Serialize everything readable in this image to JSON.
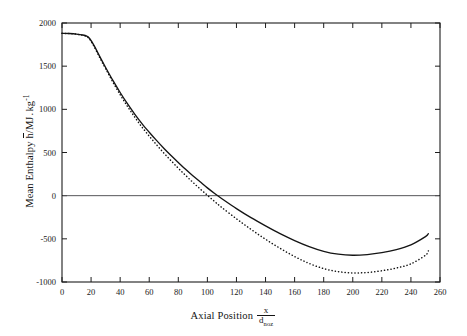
{
  "figure": {
    "background": "#ffffff",
    "foreground": "#141414",
    "zero_line_color": "#56565a"
  },
  "axes": {
    "x": {
      "label_prefix": "Axial Position",
      "label_numerator": "x",
      "label_denominator": "d",
      "label_denominator_sub": "noz",
      "ticks": [
        0,
        20,
        40,
        60,
        80,
        100,
        120,
        140,
        160,
        180,
        200,
        220,
        240,
        260
      ],
      "min": 0,
      "max": 260
    },
    "y": {
      "label_prefix": "Mean Enthalpy",
      "label_symbol": "h",
      "label_unit_num": "/MJ",
      "label_unit_sep": ".",
      "label_unit_den": "kg",
      "label_unit_exp": "-1",
      "ticks": [
        2000,
        1500,
        1000,
        500,
        0,
        -500,
        -1000
      ],
      "min": -1000,
      "max": 2000
    }
  },
  "chart_data": {
    "type": "line",
    "title": "",
    "xlabel": "Axial Position x/d_noz",
    "ylabel": "Mean Enthalpy h̄/MJ . kg⁻¹",
    "xlim": [
      0,
      260
    ],
    "ylim": [
      -1000,
      2000
    ],
    "xticks": [
      0,
      20,
      40,
      60,
      80,
      100,
      120,
      140,
      160,
      180,
      200,
      220,
      240,
      260
    ],
    "yticks": [
      2000,
      1500,
      1000,
      500,
      0,
      -500,
      -1000
    ],
    "grid": false,
    "legend": null,
    "annotations": [
      {
        "type": "hline",
        "y": 0,
        "style": "solid-thin",
        "color": "#56565a"
      }
    ],
    "series": [
      {
        "name": "solid",
        "style": "solid",
        "color": "#141414",
        "x": [
          0,
          5,
          10,
          14,
          17,
          19,
          22,
          26,
          30,
          35,
          40,
          45,
          50,
          55,
          60,
          65,
          70,
          75,
          80,
          85,
          90,
          95,
          100,
          105,
          110,
          120,
          130,
          140,
          150,
          160,
          170,
          180,
          190,
          200,
          210,
          220,
          230,
          240,
          250,
          252
        ],
        "y": [
          1880,
          1878,
          1872,
          1862,
          1848,
          1820,
          1740,
          1610,
          1485,
          1335,
          1195,
          1065,
          945,
          835,
          735,
          640,
          550,
          465,
          385,
          305,
          230,
          160,
          90,
          25,
          -35,
          -150,
          -255,
          -350,
          -440,
          -520,
          -590,
          -645,
          -678,
          -690,
          -682,
          -660,
          -625,
          -570,
          -475,
          -440
        ]
      },
      {
        "name": "dotted",
        "style": "dotted",
        "color": "#141414",
        "x": [
          0,
          5,
          10,
          14,
          17,
          19,
          22,
          26,
          30,
          35,
          40,
          45,
          50,
          55,
          60,
          65,
          70,
          75,
          80,
          85,
          90,
          95,
          100,
          105,
          110,
          120,
          130,
          140,
          150,
          160,
          170,
          180,
          190,
          200,
          210,
          220,
          230,
          240,
          250,
          252
        ],
        "y": [
          1880,
          1877,
          1870,
          1858,
          1843,
          1813,
          1730,
          1598,
          1470,
          1315,
          1170,
          1035,
          910,
          795,
          690,
          590,
          495,
          405,
          318,
          235,
          155,
          78,
          5,
          -68,
          -138,
          -268,
          -390,
          -505,
          -610,
          -705,
          -785,
          -845,
          -880,
          -895,
          -890,
          -870,
          -838,
          -790,
          -690,
          -640
        ]
      }
    ]
  }
}
